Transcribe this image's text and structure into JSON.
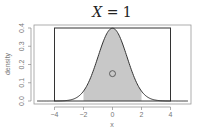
{
  "chart_data": {
    "type": "area",
    "title": "X = 1",
    "title_parts": {
      "var": "X",
      "eq": " = 1"
    },
    "xlabel": "x",
    "ylabel": "density",
    "xlim": [
      -5.2,
      5.2
    ],
    "ylim": [
      0,
      0.4
    ],
    "x_ticks": [
      -4,
      -2,
      0,
      2,
      4
    ],
    "x_tick_labels": [
      "−4",
      "−2",
      "0",
      "2",
      "4"
    ],
    "y_ticks": [
      0.0,
      0.1,
      0.2,
      0.3,
      0.4
    ],
    "y_tick_labels": [
      "0.0",
      "0.1",
      "0.2",
      "0.3",
      "0.4"
    ],
    "grid": false,
    "series": [
      {
        "name": "standard normal density",
        "kind": "line",
        "function": "dnorm(x, 0, 1)",
        "color": "#333333"
      },
      {
        "name": "shaded region",
        "kind": "area",
        "x_from": -2,
        "x_to": 2,
        "color": "#c8c8c8"
      },
      {
        "name": "uniform rectangle",
        "kind": "rect",
        "x_from": -4,
        "x_to": 4,
        "height": 0.4,
        "color": "#333333"
      }
    ],
    "annotations": [
      {
        "type": "circle",
        "x": 0,
        "y": 0.15,
        "label": ""
      }
    ]
  },
  "colors": {
    "line": "#333333",
    "fill": "#c8c8c8",
    "axis": "#888888"
  }
}
